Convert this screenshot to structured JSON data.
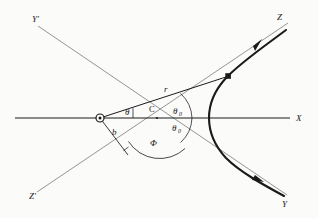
{
  "figure": {
    "background_color": "#fbfbfa",
    "stroke_color": "#1a1a1a",
    "asymptote_color": "#6b6b6b"
  },
  "axes": {
    "x_axis_label": "X",
    "y_prime_label": "Y'",
    "z_prime_label": "Z'",
    "z_label": "Z",
    "y_label": "Y"
  },
  "labels": {
    "center_point": "C",
    "radius": "r",
    "impact_parameter": "b",
    "theta": "θ",
    "theta_zero_upper": "θ",
    "theta_zero_upper_sub": "0",
    "theta_zero_lower": "θ",
    "theta_zero_lower_sub": "0",
    "phi": "Φ"
  },
  "markers": {
    "focus_marker": "open-circle-with-dot",
    "orbit_point_marker": "filled-square-dot",
    "incoming_arrow": "arrowhead-outbound-lower",
    "outgoing_arrow": "arrowhead-outbound-upper"
  },
  "geometry": {
    "focus": {
      "x": 100,
      "y": 118
    },
    "center": {
      "x": 157,
      "y": 118
    },
    "vertex": {
      "x": 210,
      "y": 118
    },
    "orbit_point": {
      "x": 228,
      "y": 76
    },
    "x_axis_start": {
      "x": 14,
      "y": 118
    },
    "x_axis_end": {
      "x": 292,
      "y": 118
    },
    "asymptote_up_start": {
      "x": 36,
      "y": 24
    },
    "asymptote_up_end": {
      "x": 286,
      "y": 196
    },
    "asymptote_dn_start": {
      "x": 36,
      "y": 193
    },
    "asymptote_dn_end": {
      "x": 288,
      "y": 22
    }
  }
}
